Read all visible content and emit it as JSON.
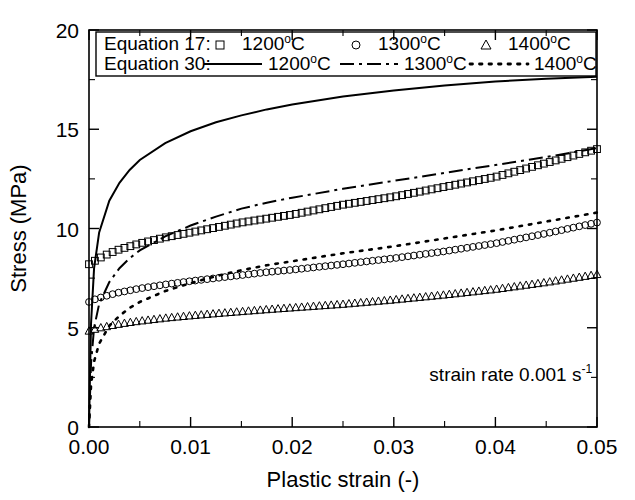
{
  "chart_data": {
    "type": "line",
    "title": "",
    "xlabel": "Plastic strain (-)",
    "ylabel": "Stress (MPa)",
    "xlim": [
      0,
      0.05
    ],
    "ylim": [
      0,
      20
    ],
    "xticks": [
      "0.00",
      "0.01",
      "0.02",
      "0.03",
      "0.04",
      "0.05"
    ],
    "xtick_values": [
      0,
      0.01,
      0.02,
      0.03,
      0.04,
      0.05
    ],
    "yticks": [
      "0",
      "5",
      "10",
      "15",
      "20"
    ],
    "ytick_values": [
      0,
      5,
      10,
      15,
      20
    ],
    "grid": false,
    "minor_ticks_x": true,
    "minor_ticks_y": true,
    "legend_position": "top-inside",
    "annotation": {
      "text_main": "strain rate 0.001 s",
      "text_sup": "-1",
      "x": 0.0335,
      "y": 2.3
    },
    "legend": {
      "row1_label": "Equation 17:",
      "row2_label": "Equation 30:",
      "entries_row1": [
        {
          "marker": "square",
          "label": "1200 ",
          "sup": "o",
          "unit": "C"
        },
        {
          "marker": "circle",
          "label": "1300 ",
          "sup": "o",
          "unit": "C"
        },
        {
          "marker": "triangle",
          "label": "1400 ",
          "sup": "o",
          "unit": "C"
        }
      ],
      "entries_row2": [
        {
          "line": "solid",
          "label": "1200 ",
          "sup": "o",
          "unit": "C"
        },
        {
          "line": "dashdot",
          "label": "1300 ",
          "sup": "o",
          "unit": "C"
        },
        {
          "line": "dotted",
          "label": "1400 ",
          "sup": "o",
          "unit": "C"
        }
      ]
    },
    "x": [
      0,
      0.0002,
      0.0005,
      0.001,
      0.002,
      0.003,
      0.004,
      0.005,
      0.0075,
      0.01,
      0.0125,
      0.015,
      0.0175,
      0.02,
      0.025,
      0.03,
      0.035,
      0.04,
      0.045,
      0.05
    ],
    "series": [
      {
        "name": "Equation 17 — 1200 °C",
        "style": "markers",
        "marker": "square",
        "temperature_C": 1200,
        "values": [
          8.2,
          8.25,
          8.35,
          8.5,
          8.75,
          8.95,
          9.1,
          9.25,
          9.55,
          9.8,
          10.05,
          10.3,
          10.5,
          10.7,
          11.2,
          11.6,
          12.1,
          12.6,
          13.3,
          14.0
        ]
      },
      {
        "name": "Equation 17 — 1300 °C",
        "style": "markers",
        "marker": "circle",
        "temperature_C": 1300,
        "values": [
          6.3,
          6.35,
          6.42,
          6.5,
          6.65,
          6.78,
          6.88,
          6.98,
          7.18,
          7.35,
          7.5,
          7.65,
          7.8,
          7.92,
          8.2,
          8.5,
          8.85,
          9.25,
          9.75,
          10.3
        ]
      },
      {
        "name": "Equation 17 — 1400 °C",
        "style": "markers",
        "marker": "triangle",
        "temperature_C": 1400,
        "values": [
          4.85,
          4.88,
          4.93,
          5.0,
          5.1,
          5.2,
          5.28,
          5.35,
          5.5,
          5.62,
          5.73,
          5.83,
          5.93,
          6.02,
          6.2,
          6.42,
          6.67,
          6.95,
          7.3,
          7.7
        ]
      },
      {
        "name": "Equation 30 — 1200 °C",
        "style": "line",
        "line": "solid",
        "temperature_C": 1200,
        "values": [
          0.0,
          5.2,
          8.0,
          9.8,
          11.4,
          12.3,
          12.95,
          13.45,
          14.3,
          14.9,
          15.35,
          15.7,
          16.0,
          16.25,
          16.65,
          16.95,
          17.2,
          17.4,
          17.55,
          17.65
        ]
      },
      {
        "name": "Equation 30 — 1300 °C",
        "style": "line",
        "line": "dashdot",
        "temperature_C": 1300,
        "values": [
          0.0,
          3.2,
          5.0,
          6.2,
          7.3,
          8.0,
          8.5,
          8.9,
          9.6,
          10.15,
          10.6,
          11.0,
          11.3,
          11.55,
          12.0,
          12.4,
          12.8,
          13.2,
          13.6,
          14.05
        ]
      },
      {
        "name": "Equation 30 — 1400 °C",
        "style": "line",
        "line": "dotted",
        "temperature_C": 1400,
        "values": [
          0.0,
          2.1,
          3.3,
          4.2,
          5.1,
          5.6,
          6.0,
          6.3,
          6.85,
          7.25,
          7.6,
          7.9,
          8.15,
          8.35,
          8.75,
          9.1,
          9.5,
          9.9,
          10.35,
          10.8
        ]
      }
    ]
  }
}
